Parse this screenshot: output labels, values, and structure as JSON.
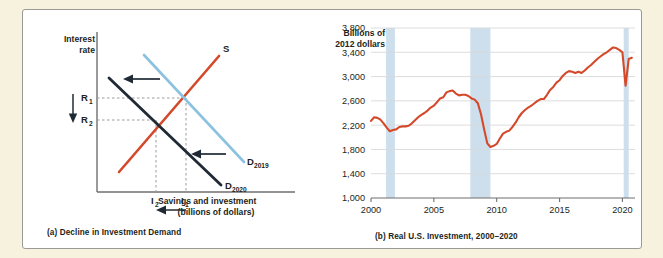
{
  "figure": {
    "background_color": "#f7f2de",
    "panel_background": "#ffffff",
    "border_color": "#9a9a96"
  },
  "panel_a": {
    "caption": "(a) Decline in Investment Demand",
    "y_axis_label_line1": "Interest",
    "y_axis_label_line2": "rate",
    "x_axis_label_line1": "Savings and investment",
    "x_axis_label_line2": "(billions of dollars)",
    "curves": [
      {
        "name": "supply",
        "label": "S",
        "color": "#d4492a"
      },
      {
        "name": "demand-2019",
        "label": "D",
        "subscript": "2019",
        "color": "#8cc2e0"
      },
      {
        "name": "demand-2020",
        "label": "D",
        "subscript": "2020",
        "color": "#1f2a35"
      }
    ],
    "markers": {
      "rate_high": "R",
      "rate_high_sub": "1",
      "rate_low": "R",
      "rate_low_sub": "2",
      "qty_low": "I",
      "qty_low_sub": "2",
      "qty_high": "I",
      "qty_high_sub": "1"
    },
    "arrow_colors": {
      "shift": "#1f2a35",
      "rate": "#1f2a35",
      "quantity": "#1f2a35"
    },
    "guide_color": "#8b8b8b"
  },
  "chart_data": {
    "type": "line",
    "title": "(b) Real U.S. Investment, 2000–2020",
    "ylabel": "Billions of 2012 dollars",
    "xlabel": "",
    "ylim": [
      1000,
      3800
    ],
    "xlim": [
      2000,
      2021
    ],
    "yticks": [
      1000,
      1400,
      1800,
      2200,
      2600,
      3000,
      3400,
      3800
    ],
    "ytick_labels": [
      "1,000",
      "1,400",
      "1,800",
      "2,200",
      "2,600",
      "3,000",
      "3,400",
      "3,800"
    ],
    "xticks": [
      2000,
      2005,
      2010,
      2015,
      2020
    ],
    "xtick_labels": [
      "2000",
      "2005",
      "2010",
      "2015",
      "2020"
    ],
    "grid": "horizontal",
    "grid_color": "#d9d9d9",
    "line_color": "#d4492a",
    "legend": "none",
    "recession_bands": [
      {
        "start": 2001.2,
        "end": 2001.9,
        "color": "#cddeec"
      },
      {
        "start": 2007.9,
        "end": 2009.5,
        "color": "#cddeec"
      },
      {
        "start": 2020.1,
        "end": 2020.5,
        "color": "#cddeec"
      }
    ],
    "series": [
      {
        "name": "Real U.S. Investment",
        "x": [
          2000.0,
          2000.25,
          2000.5,
          2000.75,
          2001.0,
          2001.25,
          2001.5,
          2001.75,
          2002.0,
          2002.25,
          2002.5,
          2002.75,
          2003.0,
          2003.25,
          2003.5,
          2003.75,
          2004.0,
          2004.25,
          2004.5,
          2004.75,
          2005.0,
          2005.25,
          2005.5,
          2005.75,
          2006.0,
          2006.25,
          2006.5,
          2006.75,
          2007.0,
          2007.25,
          2007.5,
          2007.75,
          2008.0,
          2008.25,
          2008.5,
          2008.75,
          2009.0,
          2009.25,
          2009.5,
          2009.75,
          2010.0,
          2010.25,
          2010.5,
          2010.75,
          2011.0,
          2011.25,
          2011.5,
          2011.75,
          2012.0,
          2012.25,
          2012.5,
          2012.75,
          2013.0,
          2013.25,
          2013.5,
          2013.75,
          2014.0,
          2014.25,
          2014.5,
          2014.75,
          2015.0,
          2015.25,
          2015.5,
          2015.75,
          2016.0,
          2016.25,
          2016.5,
          2016.75,
          2017.0,
          2017.25,
          2017.5,
          2017.75,
          2018.0,
          2018.25,
          2018.5,
          2018.75,
          2019.0,
          2019.25,
          2019.5,
          2019.75,
          2020.0,
          2020.25,
          2020.5,
          2020.75
        ],
        "values": [
          2270,
          2330,
          2320,
          2290,
          2230,
          2160,
          2100,
          2120,
          2130,
          2170,
          2180,
          2180,
          2190,
          2230,
          2280,
          2330,
          2370,
          2400,
          2440,
          2490,
          2520,
          2580,
          2640,
          2660,
          2740,
          2760,
          2770,
          2720,
          2690,
          2700,
          2700,
          2680,
          2640,
          2620,
          2560,
          2380,
          2130,
          1900,
          1840,
          1860,
          1890,
          1980,
          2060,
          2090,
          2110,
          2170,
          2240,
          2330,
          2400,
          2450,
          2490,
          2520,
          2560,
          2600,
          2630,
          2630,
          2700,
          2780,
          2830,
          2900,
          2940,
          3010,
          3060,
          3090,
          3080,
          3060,
          3080,
          3060,
          3100,
          3150,
          3190,
          3240,
          3290,
          3330,
          3370,
          3400,
          3440,
          3480,
          3470,
          3440,
          3400,
          2850,
          3290,
          3310
        ]
      }
    ]
  }
}
